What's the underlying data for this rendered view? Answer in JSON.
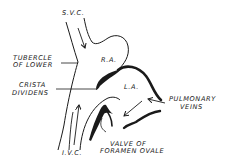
{
  "diagram": {
    "labels": {
      "svc": "S.V.C.",
      "tubercle_line1": "TUBERCLE",
      "tubercle_line2": "OF LOWER",
      "ra": "R.A.",
      "crista_line1": "CRISTA",
      "crista_line2": "DIVIDENS",
      "la": "L.A.",
      "pulmonary_line1": "PULMONARY",
      "pulmonary_line2": "VEINS",
      "valve_line1": "VALVE OF",
      "valve_line2": "FORAMEN OVALE",
      "ivc": "I.V.C."
    },
    "colors": {
      "ink": "#1a1a1a",
      "background": "#ffffff"
    }
  }
}
